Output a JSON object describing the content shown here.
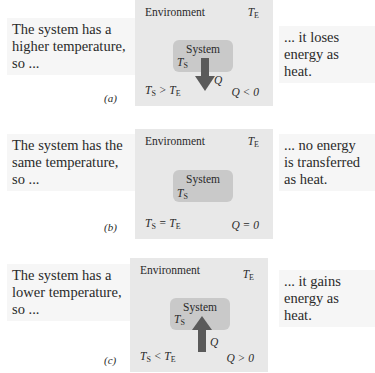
{
  "panels": [
    {
      "tag": "(a)",
      "left_text": [
        "The system has a",
        "higher temperature,",
        "so ..."
      ],
      "right_text": [
        "... it loses",
        "energy as heat."
      ],
      "environment_label": "Environment",
      "env_temp": "T",
      "env_temp_sub": "E",
      "system_label": "System",
      "sys_temp": "T",
      "sys_temp_sub": "S",
      "condition": "T_S > T_E",
      "condition_parts": [
        "T",
        "S",
        " > T",
        "E"
      ],
      "heat_label": "Q",
      "heat_condition": "Q < 0",
      "arrow_direction": "down"
    },
    {
      "tag": "(b)",
      "left_text": [
        "The system has the",
        "same temperature,",
        "so ..."
      ],
      "right_text": [
        "... no energy",
        "is transferred",
        "as heat."
      ],
      "environment_label": "Environment",
      "env_temp": "T",
      "env_temp_sub": "E",
      "system_label": "System",
      "sys_temp": "T",
      "sys_temp_sub": "S",
      "condition": "T_S = T_E",
      "condition_parts": [
        "T",
        "S",
        " = T",
        "E"
      ],
      "heat_label": "",
      "heat_condition": "Q = 0",
      "arrow_direction": "none"
    },
    {
      "tag": "(c)",
      "left_text": [
        "The system has a",
        "lower temperature,",
        "so ..."
      ],
      "right_text": [
        "... it gains",
        "energy as",
        "heat."
      ],
      "environment_label": "Environment",
      "env_temp": "T",
      "env_temp_sub": "E",
      "system_label": "System",
      "sys_temp": "T",
      "sys_temp_sub": "S",
      "condition": "T_S < T_E",
      "condition_parts": [
        "T",
        "S",
        " < T",
        "E"
      ],
      "heat_label": "Q",
      "heat_condition": "Q > 0",
      "arrow_direction": "up"
    }
  ],
  "colors": {
    "environment": "#e8e8e8",
    "system": "#c9c9c9",
    "arrow": "#5a5a5a",
    "note_background": "#f6f6f6"
  }
}
